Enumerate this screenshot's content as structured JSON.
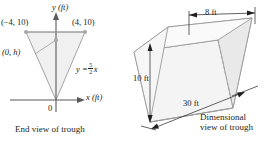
{
  "figure": {
    "colors": {
      "ink": "#231f20",
      "shape_outline": "#8c8c8c",
      "shape_fill": "#f2f2f2",
      "shape_fill_dark": "#e6e6e6",
      "axis": "#58595b"
    }
  },
  "end_view": {
    "caption": "End view of trough",
    "axis_y_label": "y (ft)",
    "axis_x_label": "x (ft)",
    "origin_label": "0",
    "points": [
      {
        "name": "top-left-vertex",
        "label": "(−4, 10)",
        "x": -4,
        "y": 10
      },
      {
        "name": "top-right-vertex",
        "label": "(4, 10)",
        "x": 4,
        "y": 10
      },
      {
        "name": "water-level-point",
        "label": "(0, h)",
        "x": 0,
        "y": "h"
      }
    ],
    "equation": {
      "lhs": "y =",
      "numerator": "5",
      "denominator": "2",
      "variable": "x",
      "full": "y = 5/2 x"
    }
  },
  "dimensional_view": {
    "caption_line1": "Dimensional",
    "caption_line2": "view of trough",
    "dimensions": [
      {
        "name": "top-width",
        "label": "8 ft",
        "value": 8,
        "unit": "ft"
      },
      {
        "name": "depth",
        "label": "10 ft",
        "value": 10,
        "unit": "ft"
      },
      {
        "name": "length",
        "label": "30 ft",
        "value": 30,
        "unit": "ft"
      }
    ]
  }
}
